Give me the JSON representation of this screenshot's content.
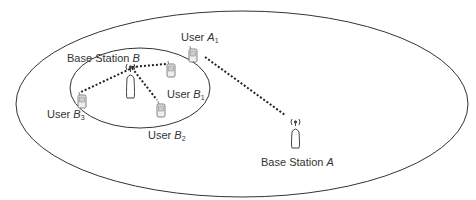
{
  "diagram": {
    "type": "cellular-network-topology",
    "macro_cell": {
      "label": "Base Station",
      "id": "A"
    },
    "small_cell": {
      "label": "Base Station",
      "id": "B"
    },
    "users": [
      {
        "prefix": "User",
        "id": "A",
        "sub": "1",
        "served_by": "A"
      },
      {
        "prefix": "User",
        "id": "B",
        "sub": "1",
        "served_by": "B"
      },
      {
        "prefix": "User",
        "id": "B",
        "sub": "2",
        "served_by": "B"
      },
      {
        "prefix": "User",
        "id": "B",
        "sub": "3",
        "served_by": "B"
      }
    ],
    "colors": {
      "line": "#333333",
      "text": "#333333",
      "background": "#ffffff"
    }
  }
}
